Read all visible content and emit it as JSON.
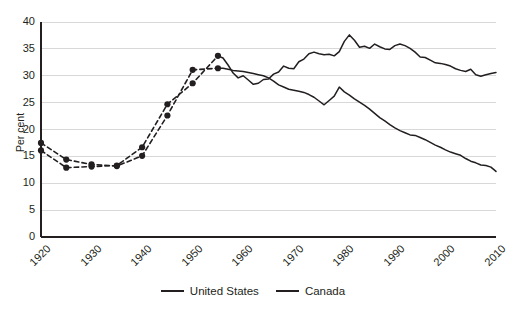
{
  "chart_data": {
    "type": "line",
    "title": "",
    "subtitle": "",
    "xlabel": "",
    "ylabel": "Per cent",
    "xlim": [
      1920,
      2010
    ],
    "ylim": [
      0,
      40
    ],
    "ytick_step": 5,
    "yticks": [
      "40",
      "35",
      "30",
      "25",
      "20",
      "15",
      "10",
      "5",
      "0"
    ],
    "xticks": [
      "1920",
      "1930",
      "1940",
      "1950",
      "1960",
      "1970",
      "1980",
      "1990",
      "2000",
      "2010"
    ],
    "grid": "horizontal",
    "legend_position": "bottom-center",
    "colors": {
      "line": "#231f20",
      "marker": "#231f20",
      "grid": "#d8d8d8",
      "axis": "#231f20",
      "background": "#ffffff"
    },
    "series": [
      {
        "name": "United States",
        "style": "solid",
        "markers": false,
        "x": [
          1955,
          1956,
          1957,
          1958,
          1959,
          1960,
          1961,
          1962,
          1963,
          1964,
          1965,
          1966,
          1967,
          1968,
          1969,
          1970,
          1971,
          1972,
          1973,
          1974,
          1975,
          1976,
          1977,
          1978,
          1979,
          1980,
          1981,
          1982,
          1983,
          1984,
          1985,
          1986,
          1987,
          1988,
          1989,
          1990,
          1991,
          1992,
          1993,
          1994,
          1995,
          1996,
          1997,
          1998,
          1999,
          2000,
          2001,
          2002,
          2003,
          2004,
          2005,
          2006,
          2007,
          2008,
          2009,
          2010
        ],
        "y": [
          31.4,
          31.4,
          31.2,
          31.0,
          30.9,
          30.8,
          30.6,
          30.4,
          30.2,
          30.0,
          29.6,
          29.0,
          28.3,
          27.9,
          27.5,
          27.3,
          27.1,
          26.9,
          26.5,
          26.0,
          25.3,
          24.6,
          25.4,
          26.2,
          27.9,
          27.0,
          26.4,
          25.7,
          25.1,
          24.5,
          23.8,
          23.0,
          22.2,
          21.6,
          20.9,
          20.3,
          19.8,
          19.4,
          19.0,
          18.9,
          18.5,
          18.1,
          17.6,
          17.1,
          16.7,
          16.2,
          15.8,
          15.5,
          15.2,
          14.6,
          14.1,
          13.8,
          13.4,
          13.3,
          13.0,
          12.2
        ]
      },
      {
        "name": "Canada",
        "style": "solid",
        "markers": false,
        "x": [
          1955,
          1956,
          1957,
          1958,
          1959,
          1960,
          1961,
          1962,
          1963,
          1964,
          1965,
          1966,
          1967,
          1968,
          1969,
          1970,
          1971,
          1972,
          1973,
          1974,
          1975,
          1976,
          1977,
          1978,
          1979,
          1980,
          1981,
          1982,
          1983,
          1984,
          1985,
          1986,
          1987,
          1988,
          1989,
          1990,
          1991,
          1992,
          1993,
          1994,
          1995,
          1996,
          1997,
          1998,
          1999,
          2000,
          2001,
          2002,
          2003,
          2004,
          2005,
          2006,
          2007,
          2008,
          2009,
          2010
        ],
        "y": [
          33.7,
          33.3,
          32.0,
          30.5,
          29.6,
          30.0,
          29.2,
          28.4,
          28.6,
          29.3,
          29.4,
          30.3,
          30.7,
          31.8,
          31.4,
          31.3,
          32.6,
          33.1,
          34.1,
          34.4,
          34.1,
          33.9,
          34.0,
          33.7,
          34.5,
          36.4,
          37.6,
          36.6,
          35.3,
          35.5,
          35.1,
          35.9,
          35.4,
          35.0,
          34.9,
          35.6,
          35.9,
          35.6,
          35.1,
          34.4,
          33.5,
          33.4,
          32.9,
          32.4,
          32.3,
          32.1,
          31.8,
          31.3,
          31.0,
          30.8,
          31.2,
          30.2,
          29.9,
          30.2,
          30.4,
          30.6
        ]
      },
      {
        "name": "United States (early, dashed)",
        "style": "dashed",
        "markers": true,
        "x": [
          1920,
          1925,
          1930,
          1935,
          1940,
          1945,
          1950,
          1955
        ],
        "y": [
          17.5,
          14.4,
          13.5,
          13.2,
          15.1,
          22.6,
          31.1,
          31.4
        ]
      },
      {
        "name": "Canada (early, dashed)",
        "style": "dashed",
        "markers": true,
        "x": [
          1920,
          1925,
          1930,
          1935,
          1940,
          1945,
          1950,
          1955
        ],
        "y": [
          16.1,
          12.9,
          13.1,
          13.3,
          16.7,
          24.7,
          28.6,
          33.7
        ]
      }
    ],
    "legend": [
      {
        "label": "United States",
        "style": "solid"
      },
      {
        "label": "Canada",
        "style": "solid"
      }
    ]
  }
}
